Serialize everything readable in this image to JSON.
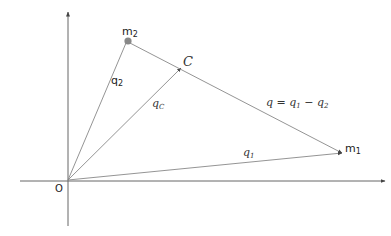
{
  "diagram": {
    "origin_label": "O",
    "points": {
      "m1": {
        "label": "m",
        "sub": "1"
      },
      "m2": {
        "label": "m",
        "sub": "2"
      },
      "C": {
        "label": "C"
      }
    },
    "vectors": {
      "q1": {
        "label": "q",
        "sub": "1"
      },
      "q2": {
        "label": "q",
        "sub": "2"
      },
      "qC": {
        "label": "q",
        "sub": "C"
      },
      "q": {
        "label": "q = q",
        "sub1": "1",
        "mid": " − q",
        "sub2": "2"
      }
    },
    "colors": {
      "line": "#777777",
      "axis": "#555555",
      "mass_dot": "#888888"
    }
  }
}
